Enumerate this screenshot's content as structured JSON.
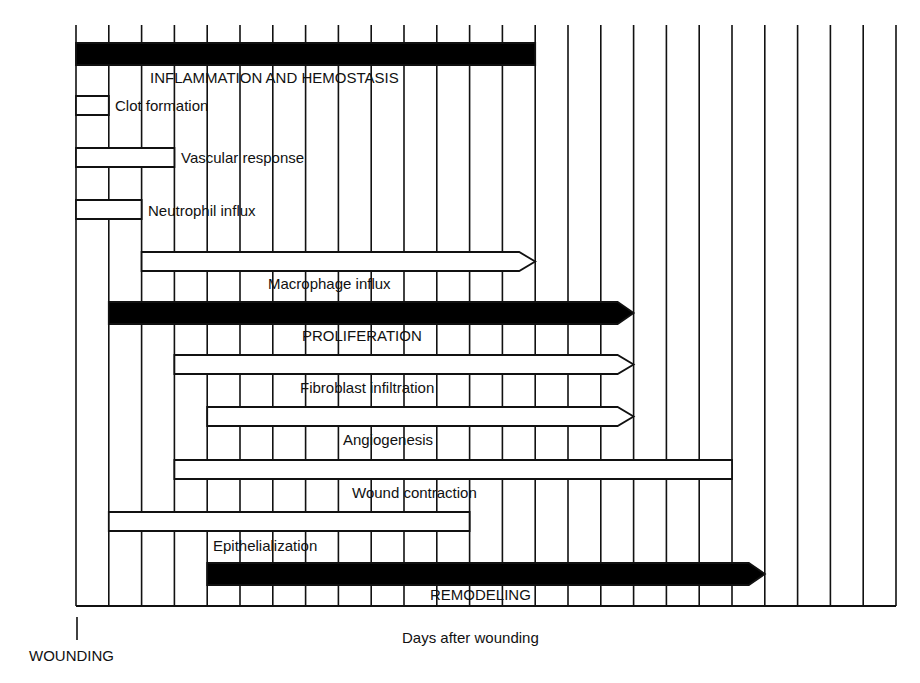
{
  "chart_data": {
    "type": "gantt",
    "title": "",
    "xlabel": "Days after wounding",
    "origin_label": "WOUNDING",
    "grid": true,
    "grid_columns": 25,
    "x_unit_note": "Unlabeled time columns; each gridline is one interval after wounding",
    "tasks": [
      {
        "name": "INFLAMMATION AND HEMOSTASIS",
        "kind": "phase",
        "fill": "#000000",
        "start": 0,
        "end": 14,
        "arrow": false
      },
      {
        "name": "Clot formation",
        "kind": "event",
        "fill": "#ffffff",
        "start": 0,
        "end": 1,
        "arrow": false
      },
      {
        "name": "Vascular response",
        "kind": "event",
        "fill": "#ffffff",
        "start": 0,
        "end": 3,
        "arrow": false
      },
      {
        "name": "Neutrophil influx",
        "kind": "event",
        "fill": "#ffffff",
        "start": 0,
        "end": 2,
        "arrow": false
      },
      {
        "name": "Macrophage influx",
        "kind": "event",
        "fill": "#ffffff",
        "start": 2,
        "end": 14,
        "arrow": true
      },
      {
        "name": "PROLIFERATION",
        "kind": "phase",
        "fill": "#000000",
        "start": 1,
        "end": 17,
        "arrow": true
      },
      {
        "name": "Fibroblast infiltration",
        "kind": "event",
        "fill": "#ffffff",
        "start": 3,
        "end": 17,
        "arrow": true
      },
      {
        "name": "Angiogenesis",
        "kind": "event",
        "fill": "#ffffff",
        "start": 4,
        "end": 17,
        "arrow": true
      },
      {
        "name": "Wound contraction",
        "kind": "event",
        "fill": "#ffffff",
        "start": 3,
        "end": 20,
        "arrow": false
      },
      {
        "name": "Epithelialization",
        "kind": "event",
        "fill": "#ffffff",
        "start": 1,
        "end": 12,
        "arrow": false
      },
      {
        "name": "REMODELING",
        "kind": "phase",
        "fill": "#000000",
        "start": 4,
        "end": 21,
        "arrow": true
      }
    ]
  },
  "labels": {
    "inflammation": "INFLAMMATION AND HEMOSTASIS",
    "clot": "Clot formation",
    "vascular": "Vascular response",
    "neutrophil": "Neutrophil  influx",
    "macrophage": "Macrophage influx",
    "proliferation": "PROLIFERATION",
    "fibroblast": "Fibroblast infiltration",
    "angiogenesis": "Angiogenesis",
    "wound_contraction": "Wound contraction",
    "epithelialization": "Epithelialization",
    "remodeling": "REMODELING",
    "xlabel": "Days after wounding",
    "wounding": "WOUNDING"
  }
}
